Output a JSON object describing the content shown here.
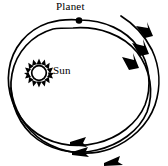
{
  "figure": {
    "width": 168,
    "height": 166,
    "background_color": "#ffffff",
    "stroke_color": "#000000"
  },
  "labels": {
    "planet": "Planet",
    "sun": "Sun"
  },
  "bodies": {
    "sun": {
      "name": "Sun",
      "center_x": 39,
      "center_y": 73,
      "core_radius": 7.5,
      "spike_count": 16,
      "spike_length": 5,
      "color": "#000000"
    },
    "planet": {
      "name": "Planet",
      "center_x": 79,
      "center_y": 21,
      "radius": 3.2,
      "color": "#000000"
    }
  },
  "orbits": [
    {
      "name": "orbit-arc-1",
      "rotation_deg": -6,
      "stroke_width": 1.6,
      "path": "M 79 21 C 110 23 138 44 142 73 C 146 104 124 134 95 143 C 66 152 33 138 20 112 C 8 87 12 53 33 34 C 46 22 63 19 79 21"
    },
    {
      "name": "orbit-arc-2",
      "rotation_deg": 4,
      "stroke_width": 1.6,
      "path": "M 74 27 C 106 27 136 48 141 78 C 146 109 124 139 94 148 C 64 157 32 142 19 116 C 7 91 12 57 33 39 C 45 29 60 26 74 27"
    },
    {
      "name": "orbit-arc-3",
      "rotation_deg": 12,
      "stroke_width": 1.6,
      "path": "M 122 17 C 140 29 154 50 155 72 C 157 100 139 128 112 140 C 84 152 50 145 32 124 C 14 102 12 68 28 46"
    }
  ],
  "arrows": [
    {
      "name": "arrow-right-upper",
      "direction": "down-right",
      "x": 143,
      "y": 31
    },
    {
      "name": "arrow-right-middle",
      "direction": "down-right",
      "x": 139,
      "y": 48
    },
    {
      "name": "arrow-right-lower",
      "direction": "down",
      "x": 131,
      "y": 62
    },
    {
      "name": "arrow-bottom-upper",
      "direction": "left",
      "x": 76,
      "y": 142
    },
    {
      "name": "arrow-bottom-middle",
      "direction": "left",
      "x": 78,
      "y": 152
    },
    {
      "name": "arrow-bottom-lower",
      "direction": "left",
      "x": 110,
      "y": 161
    }
  ],
  "direction_of_motion": "counterclockwise"
}
